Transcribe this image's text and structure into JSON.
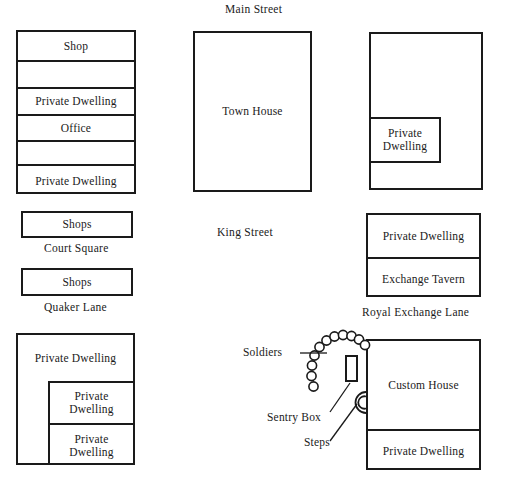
{
  "figure": {
    "kind": "site-plan",
    "ink_color": "#1a1a1a",
    "paper_color": "#ffffff"
  },
  "streets": [
    {
      "name": "main-street",
      "label": "Main Street"
    },
    {
      "name": "king-street",
      "label": "King Street"
    },
    {
      "name": "court-square",
      "label": "Court Square"
    },
    {
      "name": "quaker-lane",
      "label": "Quaker Lane"
    },
    {
      "name": "royal-exchange-lane",
      "label": "Royal Exchange Lane"
    }
  ],
  "blocks": {
    "northwest_row": {
      "name": "northwest-building-row",
      "cells": [
        {
          "label": "Shop"
        },
        {
          "label": ""
        },
        {
          "label": "Private Dwelling"
        },
        {
          "label": "Office"
        },
        {
          "label": ""
        },
        {
          "label": "Private Dwelling"
        }
      ]
    },
    "court_square_shops": {
      "label": "Shops"
    },
    "quaker_lane_shops": {
      "label": "Shops"
    },
    "southwest_building": {
      "name": "southwest-building",
      "outer_label": "Private Dwelling",
      "inner_cells": [
        {
          "label": "Private\nDwelling"
        },
        {
          "label": "Private\nDwelling"
        }
      ]
    },
    "town_house": {
      "label": "Town House"
    },
    "northeast_building": {
      "name": "northeast-building",
      "cells": [
        {
          "label": "Private\nDwelling"
        }
      ]
    },
    "exchange_block": {
      "name": "exchange-block",
      "cells": [
        {
          "label": "Private Dwelling"
        },
        {
          "label": "Exchange Tavern"
        }
      ]
    },
    "custom_house_block": {
      "name": "custom-house-block",
      "cells": [
        {
          "label": "Custom House"
        },
        {
          "label": "Private Dwelling"
        }
      ]
    }
  },
  "annotations": [
    {
      "name": "soldiers-label",
      "label": "Soldiers",
      "leader": "horizontal"
    },
    {
      "name": "sentry-box-label",
      "label": "Sentry Box",
      "leader": "diagonal"
    },
    {
      "name": "steps-label",
      "label": "Steps",
      "leader": "diagonal"
    }
  ],
  "soldiers": {
    "name": "soldier-markers",
    "count": 11,
    "shape": "circle",
    "arrangement": "arc",
    "radius_px": 4.6
  },
  "sentry_box": {
    "name": "sentry-box",
    "shape": "rectangle"
  },
  "steps": {
    "name": "steps",
    "shape": "concentric-semicircles",
    "arc_count": 2
  }
}
